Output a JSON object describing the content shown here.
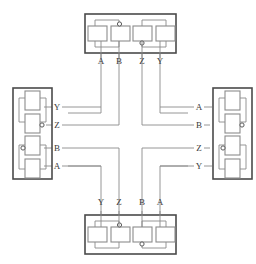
{
  "diagram": {
    "type": "block-diagram",
    "background_color": "#ffffff",
    "module_border_color": "#4a4a4a",
    "gate_border_color": "#8c8c8c",
    "wire_color": "#8a8a8a",
    "label_color": "#3a3a3a",
    "signal_names": [
      "A",
      "B",
      "Z",
      "Y"
    ],
    "module_count": 4,
    "gates_per_module": 4
  },
  "modules": {
    "top": {
      "name": "top-module",
      "position": "top",
      "port_labels": [
        "A",
        "B",
        "Z",
        "Y"
      ],
      "gates": [
        {
          "id": "top-gate-1",
          "bubble": "none"
        },
        {
          "id": "top-gate-2",
          "bubble": "top"
        },
        {
          "id": "top-gate-3",
          "bubble": "bottom"
        },
        {
          "id": "top-gate-4",
          "bubble": "none"
        }
      ]
    },
    "right": {
      "name": "right-module",
      "position": "right",
      "port_labels": [
        "A",
        "B",
        "Z",
        "Y"
      ],
      "gates": [
        {
          "id": "right-gate-1",
          "bubble": "none"
        },
        {
          "id": "right-gate-2",
          "bubble": "right"
        },
        {
          "id": "right-gate-3",
          "bubble": "left"
        },
        {
          "id": "right-gate-4",
          "bubble": "none"
        }
      ]
    },
    "bottom": {
      "name": "bottom-module",
      "position": "bottom",
      "port_labels": [
        "Y",
        "Z",
        "B",
        "A"
      ],
      "gates": [
        {
          "id": "bottom-gate-1",
          "bubble": "none"
        },
        {
          "id": "bottom-gate-2",
          "bubble": "top"
        },
        {
          "id": "bottom-gate-3",
          "bubble": "bottom"
        },
        {
          "id": "bottom-gate-4",
          "bubble": "none"
        }
      ]
    },
    "left": {
      "name": "left-module",
      "position": "left",
      "port_labels": [
        "Y",
        "Z",
        "B",
        "A"
      ],
      "gates": [
        {
          "id": "left-gate-1",
          "bubble": "none"
        },
        {
          "id": "left-gate-2",
          "bubble": "right"
        },
        {
          "id": "left-gate-3",
          "bubble": "left"
        },
        {
          "id": "left-gate-4",
          "bubble": "none"
        }
      ]
    }
  },
  "labels": {
    "top": [
      {
        "text": "A",
        "x": 101,
        "y": 64
      },
      {
        "text": "B",
        "x": 119,
        "y": 64
      },
      {
        "text": "Z",
        "x": 142,
        "y": 64
      },
      {
        "text": "Y",
        "x": 160,
        "y": 64
      }
    ],
    "bottom": [
      {
        "text": "Y",
        "x": 101,
        "y": 205
      },
      {
        "text": "Z",
        "x": 119,
        "y": 205
      },
      {
        "text": "B",
        "x": 142,
        "y": 205
      },
      {
        "text": "A",
        "x": 160,
        "y": 205
      }
    ],
    "left": [
      {
        "text": "Y",
        "x": 57,
        "y": 107
      },
      {
        "text": "Z",
        "x": 57,
        "y": 125
      },
      {
        "text": "B",
        "x": 57,
        "y": 148
      },
      {
        "text": "A",
        "x": 57,
        "y": 166
      }
    ],
    "right": [
      {
        "text": "A",
        "x": 199,
        "y": 107
      },
      {
        "text": "B",
        "x": 199,
        "y": 125
      },
      {
        "text": "Z",
        "x": 199,
        "y": 148
      },
      {
        "text": "Y",
        "x": 199,
        "y": 166
      }
    ]
  }
}
